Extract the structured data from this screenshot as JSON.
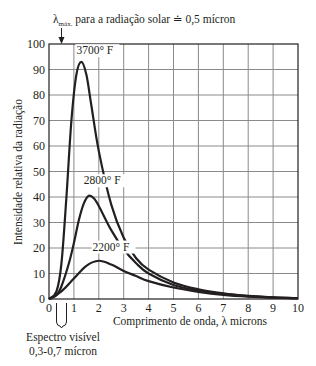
{
  "chart_data": {
    "type": "line",
    "title": "",
    "annotation_top": "λmáx. para a radiação solar ≐ 0,5 mícron",
    "annotation_top_sub": "máx.",
    "annotation_top_lambda": "λ",
    "annotation_top_rest": " para a radiação solar ≐ 0,5 mícron",
    "annotation_bottom_line1": "Espectro visível",
    "annotation_bottom_line2": "0,3-0,7 mícron",
    "xlabel": "Comprimento de onda, λ microns",
    "ylabel": "Intensidade relativa da radiação",
    "xlim": [
      0,
      10
    ],
    "ylim": [
      0,
      100
    ],
    "x_ticks": [
      "0",
      "1",
      "2",
      "3",
      "4",
      "5",
      "6",
      "7",
      "8",
      "9",
      "10"
    ],
    "y_ticks": [
      "0",
      "10",
      "20",
      "30",
      "40",
      "50",
      "60",
      "70",
      "80",
      "90",
      "100"
    ],
    "grid": true,
    "legend": "none (inline curve labels)",
    "series": [
      {
        "name": "3700° F",
        "x": [
          0,
          0.3,
          0.5,
          0.7,
          0.9,
          1.1,
          1.3,
          1.5,
          1.7,
          2.0,
          2.5,
          3.0,
          3.5,
          4.0,
          5.0,
          6.0,
          7.0,
          8.0,
          9.0,
          10.0
        ],
        "values": [
          0,
          3,
          14,
          40,
          70,
          88,
          93,
          88,
          76,
          58,
          37,
          24,
          16,
          11.5,
          6.5,
          3.8,
          2.2,
          1.2,
          0.6,
          0.3
        ]
      },
      {
        "name": "2800° F",
        "x": [
          0,
          0.3,
          0.5,
          0.8,
          1.0,
          1.2,
          1.4,
          1.6,
          1.8,
          2.0,
          2.5,
          3.0,
          3.5,
          4.0,
          5.0,
          6.0,
          7.0,
          8.0,
          9.0,
          10.0
        ],
        "values": [
          0,
          1.5,
          5,
          14,
          22,
          31,
          37.5,
          40.5,
          39.5,
          36.5,
          27,
          19.5,
          14,
          10,
          5.5,
          3.3,
          2,
          1.1,
          0.6,
          0.3
        ]
      },
      {
        "name": "2200° F",
        "x": [
          0,
          0.5,
          1.0,
          1.5,
          2.0,
          2.5,
          3.0,
          3.5,
          4.0,
          5.0,
          6.0,
          7.0,
          8.0,
          9.0,
          10.0
        ],
        "values": [
          0,
          3,
          8,
          13,
          15,
          13.5,
          11,
          9,
          7,
          4.5,
          2.8,
          1.6,
          0.9,
          0.5,
          0.3
        ]
      }
    ],
    "curve_labels": [
      {
        "text": "3700° F",
        "x": 1.1,
        "y": 96
      },
      {
        "text": "2800° F",
        "x": 1.4,
        "y": 45
      },
      {
        "text": "2200° F",
        "x": 1.75,
        "y": 19
      }
    ],
    "colors": {
      "curve": "#231f20",
      "grid": "#8a8a8a",
      "axis": "#231f20"
    }
  }
}
